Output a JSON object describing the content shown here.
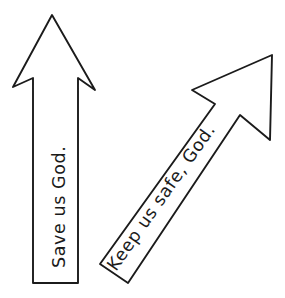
{
  "scene": {
    "title": "Hand-drawn prayer arrows",
    "background_color": "#ffffff",
    "stroke_color": "#1b1b1b",
    "width": 285,
    "height": 298
  },
  "arrows": [
    {
      "id": "left-arrow",
      "caption": "Save us God.",
      "direction": "up",
      "rotation_deg": -90,
      "outline_points": "52,15 95,90 78,78 78,283 33,283 33,78 13,87",
      "caption_x": 65,
      "caption_y": 268,
      "fill_color": "#ffffff",
      "stroke_color": "#1b1b1b"
    },
    {
      "id": "right-arrow",
      "caption": "Keep us safe, God.",
      "direction": "up-right",
      "rotation_deg": -50,
      "outline_points": "272,55 270,140 240,115 128,283 100,264 215,104 192,90",
      "caption_x": 116,
      "caption_y": 272,
      "fill_color": "#ffffff",
      "stroke_color": "#1b1b1b"
    }
  ]
}
